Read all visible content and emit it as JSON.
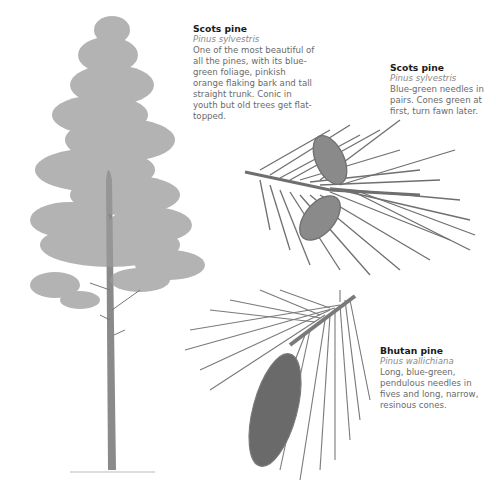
{
  "captions": [
    {
      "title": "Scots pine",
      "latin": "Pinus sylvestris",
      "description": "One of the most beautiful of all the pines, with its blue-green foliage, pinkish orange flaking bark and tall straight trunk. Conic in youth but old trees get flat-topped."
    },
    {
      "title": "Scots pine",
      "latin": "Pinus sylvestris",
      "description": "Blue-green needles in pairs. Cones green at first, turn fawn later."
    },
    {
      "title": "Bhutan pine",
      "latin": "Pinus wallichiana",
      "description": "Long, blue-green, pendulous needles in fives and long, narrow, resinous cones."
    }
  ],
  "illustrations": [
    {
      "subject": "Scots pine tree"
    },
    {
      "subject": "Scots pine shoot with cones"
    },
    {
      "subject": "Bhutan pine shoot with cone"
    }
  ],
  "colors": {
    "background": "#ffffff",
    "title_text": "#1a1a1a",
    "body_text": "#6a6a6a",
    "latin_text": "#8a8a8a",
    "illustration_grey": "#7a7a7a"
  }
}
